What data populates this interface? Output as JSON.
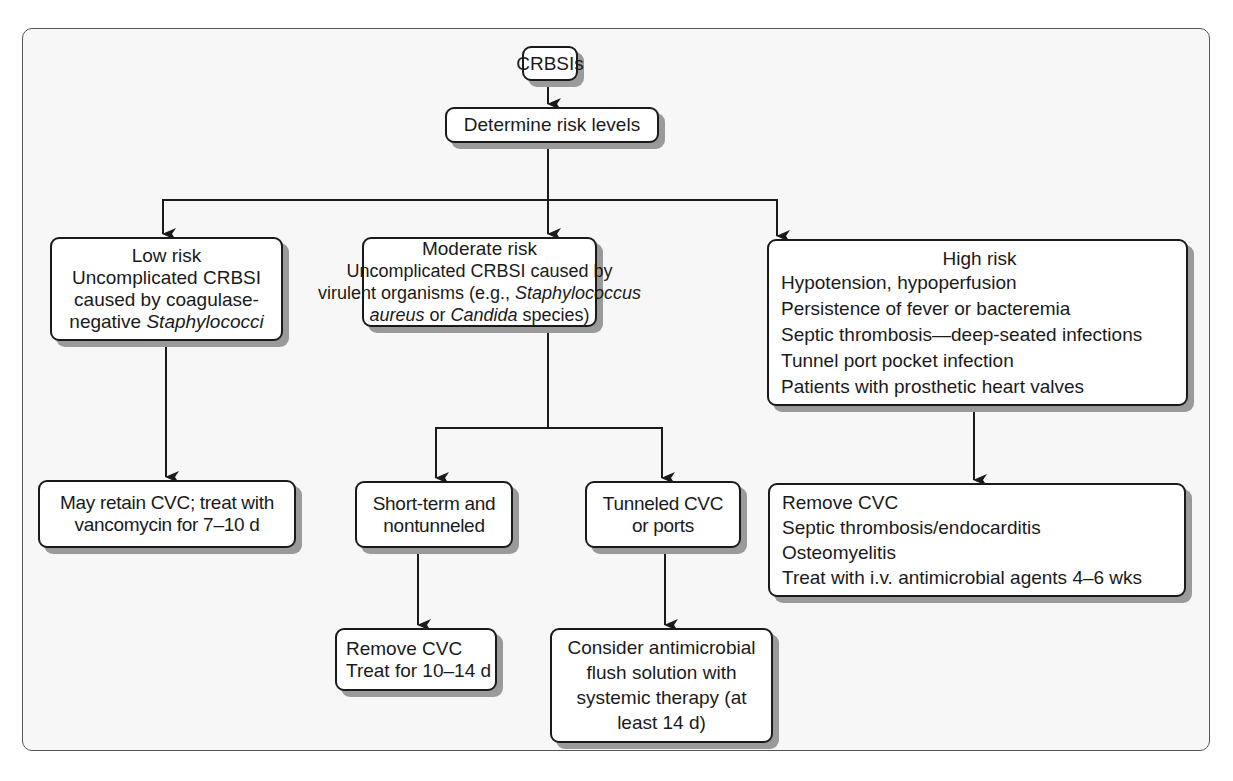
{
  "diagram": {
    "root": {
      "label": "CRBSIs"
    },
    "step": {
      "label": "Determine risk levels"
    },
    "low_risk": {
      "title": "Low risk",
      "lines": [
        "Uncomplicated CRBSI",
        "caused by coagulase-"
      ],
      "line3_prefix": "negative ",
      "line3_italic": "Staphylococci"
    },
    "moderate_risk": {
      "title": "Moderate risk",
      "line1": "Uncomplicated CRBSI caused by",
      "line2_prefix": "virulent organisms (e.g., ",
      "line2_italic": "Staphylococcus",
      "line3_italic_a": "aureus",
      "line3_mid": " or ",
      "line3_italic_b": "Candida",
      "line3_suffix": " species)"
    },
    "high_risk": {
      "title": "High risk",
      "items": [
        "Hypotension, hypoperfusion",
        "Persistence of fever or bacteremia",
        "Septic thrombosis—deep-seated infections",
        "Tunnel port pocket infection",
        "Patients with prosthetic heart valves"
      ]
    },
    "low_outcome": {
      "lines": [
        "May retain CVC; treat with",
        "vancomycin for 7–10 d"
      ]
    },
    "short_term": {
      "lines": [
        "Short-term and",
        "nontunneled"
      ]
    },
    "tunneled": {
      "lines": [
        "Tunneled CVC",
        "or ports"
      ]
    },
    "high_outcome": {
      "items": [
        "Remove CVC",
        "Septic thrombosis/endocarditis",
        "Osteomyelitis",
        "Treat with i.v. antimicrobial agents 4–6 wks"
      ]
    },
    "short_outcome": {
      "lines": [
        "Remove CVC",
        "Treat for 10–14 d"
      ]
    },
    "tunneled_outcome": {
      "lines": [
        "Consider antimicrobial",
        "flush solution with",
        "systemic therapy (at",
        "least 14 d)"
      ]
    },
    "colors": {
      "frame_bg": "#f7f7f7",
      "box_bg": "#ffffff",
      "stroke": "#1a1a1a",
      "shadow": "#9a9a9a"
    }
  }
}
